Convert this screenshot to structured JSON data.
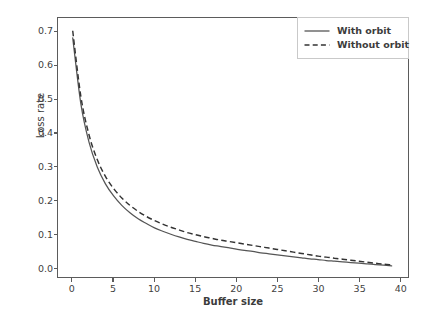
{
  "chart_data": {
    "type": "line",
    "title": "",
    "xlabel": "Buffer size",
    "ylabel": "Loss rate",
    "xlim": [
      -1.8,
      41.0
    ],
    "ylim": [
      -0.028,
      0.742
    ],
    "grid": false,
    "legend_position": "upper right",
    "xticks": [
      "0",
      "5",
      "10",
      "15",
      "20",
      "25",
      "30",
      "35",
      "40"
    ],
    "xtick_values": [
      0,
      5,
      10,
      15,
      20,
      25,
      30,
      35,
      40
    ],
    "yticks": [
      "0.0",
      "0.1",
      "0.2",
      "0.3",
      "0.4",
      "0.5",
      "0.6",
      "0.7"
    ],
    "ytick_values": [
      0.0,
      0.1,
      0.2,
      0.3,
      0.4,
      0.5,
      0.6,
      0.7
    ],
    "x": [
      0,
      1,
      2,
      3,
      4,
      5,
      6,
      7,
      8,
      9,
      10,
      11,
      12,
      13,
      14,
      15,
      16,
      17,
      18,
      19,
      20,
      21,
      22,
      23,
      24,
      25,
      26,
      27,
      28,
      29,
      30,
      31,
      32,
      33,
      34,
      35,
      36,
      37,
      38,
      39
    ],
    "series": [
      {
        "name": "With orbit",
        "style": "solid",
        "color": "#555555",
        "values": [
          0.683,
          0.486,
          0.372,
          0.299,
          0.249,
          0.213,
          0.185,
          0.163,
          0.145,
          0.131,
          0.118,
          0.108,
          0.099,
          0.091,
          0.084,
          0.078,
          0.072,
          0.067,
          0.063,
          0.059,
          0.055,
          0.051,
          0.048,
          0.044,
          0.041,
          0.038,
          0.035,
          0.032,
          0.029,
          0.026,
          0.024,
          0.021,
          0.019,
          0.017,
          0.015,
          0.013,
          0.011,
          0.009,
          0.007,
          0.005
        ]
      },
      {
        "name": "Without orbit",
        "style": "dashed",
        "color": "#333333",
        "values": [
          0.704,
          0.508,
          0.394,
          0.321,
          0.271,
          0.235,
          0.207,
          0.185,
          0.167,
          0.152,
          0.14,
          0.129,
          0.12,
          0.112,
          0.104,
          0.098,
          0.092,
          0.087,
          0.082,
          0.078,
          0.074,
          0.07,
          0.066,
          0.062,
          0.058,
          0.054,
          0.05,
          0.046,
          0.042,
          0.038,
          0.034,
          0.031,
          0.028,
          0.025,
          0.022,
          0.019,
          0.016,
          0.013,
          0.01,
          0.008
        ]
      }
    ]
  },
  "legend": {
    "items": [
      {
        "label": "With orbit"
      },
      {
        "label": "Without orbit"
      }
    ]
  }
}
